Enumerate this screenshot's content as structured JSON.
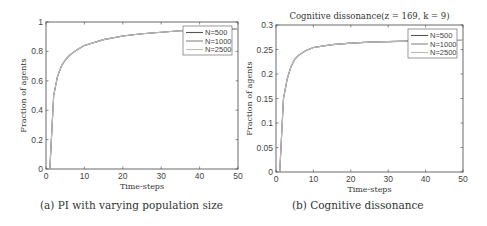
{
  "chart_data": [
    {
      "type": "line",
      "title": "",
      "caption": "(a) PI with varying population size",
      "xlabel": "Time-steps",
      "ylabel": "Fraction of agents",
      "xlim": [
        0,
        50
      ],
      "ylim": [
        0,
        1
      ],
      "xticks": [
        0,
        10,
        20,
        30,
        40,
        50
      ],
      "yticks": [
        0,
        0.2,
        0.4,
        0.6,
        0.8,
        1
      ],
      "ytick_labels": [
        "0",
        "0.2",
        "0.4",
        "0.6",
        "0.8",
        "1"
      ],
      "grid": false,
      "legend_position": "upper right",
      "x": [
        1,
        2,
        3,
        4,
        5,
        6,
        8,
        10,
        15,
        20,
        25,
        30,
        35,
        40,
        45,
        50
      ],
      "series": [
        {
          "name": "N=500",
          "color": "#555555",
          "values": [
            0,
            0.5,
            0.63,
            0.7,
            0.74,
            0.77,
            0.81,
            0.84,
            0.88,
            0.905,
            0.92,
            0.93,
            0.94,
            0.945,
            0.95,
            0.955
          ]
        },
        {
          "name": "N=1000",
          "color": "#888888",
          "values": [
            0,
            0.5,
            0.63,
            0.7,
            0.74,
            0.77,
            0.81,
            0.84,
            0.88,
            0.905,
            0.92,
            0.93,
            0.94,
            0.945,
            0.95,
            0.955
          ]
        },
        {
          "name": "N=2500",
          "color": "#bbbbbb",
          "values": [
            0,
            0.5,
            0.63,
            0.7,
            0.74,
            0.77,
            0.81,
            0.84,
            0.88,
            0.905,
            0.92,
            0.93,
            0.94,
            0.945,
            0.95,
            0.955
          ]
        }
      ]
    },
    {
      "type": "line",
      "title": "Cognitive dissonance(z = 169, k = 9)",
      "caption": "(b) Cognitive dissonance",
      "xlabel": "Time-steps",
      "ylabel": "Fraction of agents",
      "xlim": [
        0,
        50
      ],
      "ylim": [
        0,
        0.3
      ],
      "xticks": [
        0,
        10,
        20,
        30,
        40,
        50
      ],
      "yticks": [
        0,
        0.05,
        0.1,
        0.15,
        0.2,
        0.25,
        0.3
      ],
      "ytick_labels": [
        "0",
        "0.05",
        "0.1",
        "0.15",
        "0.2",
        "0.25",
        "0.3"
      ],
      "grid": false,
      "legend_position": "upper right",
      "x": [
        1,
        2,
        3,
        4,
        5,
        6,
        8,
        10,
        15,
        20,
        25,
        30,
        35,
        40,
        45,
        50
      ],
      "series": [
        {
          "name": "N=500",
          "color": "#555555",
          "values": [
            0,
            0.15,
            0.19,
            0.215,
            0.23,
            0.238,
            0.248,
            0.254,
            0.26,
            0.263,
            0.265,
            0.266,
            0.267,
            0.268,
            0.268,
            0.269
          ]
        },
        {
          "name": "N=1000",
          "color": "#888888",
          "values": [
            0,
            0.15,
            0.19,
            0.215,
            0.23,
            0.238,
            0.248,
            0.254,
            0.26,
            0.263,
            0.265,
            0.266,
            0.267,
            0.268,
            0.268,
            0.269
          ]
        },
        {
          "name": "N=2500",
          "color": "#bbbbbb",
          "values": [
            0,
            0.15,
            0.19,
            0.215,
            0.23,
            0.238,
            0.248,
            0.254,
            0.26,
            0.263,
            0.265,
            0.266,
            0.267,
            0.268,
            0.268,
            0.269
          ]
        }
      ]
    }
  ]
}
